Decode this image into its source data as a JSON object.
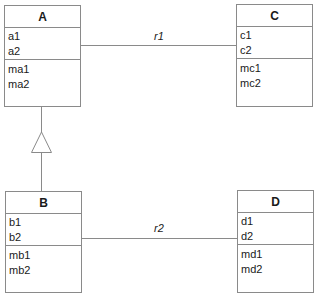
{
  "diagram": {
    "type": "UML class diagram",
    "classes": [
      {
        "id": "A",
        "name": "A",
        "attributes": [
          "a1",
          "a2"
        ],
        "operations": [
          "ma1",
          "ma2"
        ]
      },
      {
        "id": "B",
        "name": "B",
        "attributes": [
          "b1",
          "b2"
        ],
        "operations": [
          "mb1",
          "mb2"
        ]
      },
      {
        "id": "C",
        "name": "C",
        "attributes": [
          "c1",
          "c2"
        ],
        "operations": [
          "mc1",
          "mc2"
        ]
      },
      {
        "id": "D",
        "name": "D",
        "attributes": [
          "d1",
          "d2"
        ],
        "operations": [
          "md1",
          "md2"
        ]
      }
    ],
    "relationships": [
      {
        "type": "association",
        "from": "A",
        "to": "C",
        "label": "r1"
      },
      {
        "type": "association",
        "from": "B",
        "to": "D",
        "label": "r2"
      },
      {
        "type": "generalization",
        "from": "B",
        "to": "A",
        "label": ""
      }
    ]
  }
}
